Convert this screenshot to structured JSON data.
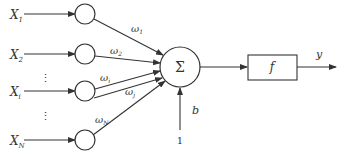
{
  "diagram": {
    "type": "perceptron-neuron-model",
    "inputs": [
      {
        "label": "X",
        "sub": "1",
        "y": 15
      },
      {
        "label": "X",
        "sub": "2",
        "y": 55
      },
      {
        "label": "X",
        "sub": "i",
        "y": 92
      },
      {
        "label": "X",
        "sub": "N",
        "y": 141
      }
    ],
    "ellipses": [
      {
        "symbol": "⋮",
        "y": 78
      },
      {
        "symbol": "⋮",
        "y": 116
      }
    ],
    "weights": [
      {
        "label": "ω",
        "sub": "1"
      },
      {
        "label": "ω",
        "sub": "2"
      },
      {
        "label": "ω",
        "sub": "i"
      },
      {
        "label": "ω",
        "sub": "j"
      },
      {
        "label": "ω",
        "sub": "N"
      }
    ],
    "summation": {
      "symbol": "Σ"
    },
    "bias": {
      "label": "b",
      "input": "1"
    },
    "activation": {
      "label": "f"
    },
    "output": {
      "label": "y"
    }
  }
}
